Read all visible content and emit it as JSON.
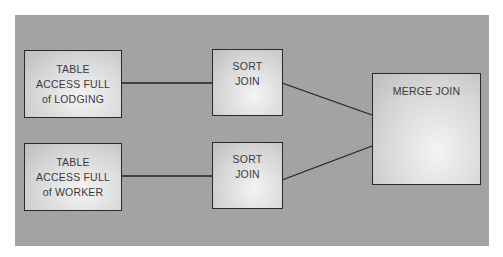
{
  "diagram": {
    "background_color": "#a3a3a3",
    "nodes": [
      {
        "id": "table_access_lodging",
        "label_lines": [
          "TABLE",
          "ACCESS FULL",
          "of LODGING"
        ]
      },
      {
        "id": "table_access_worker",
        "label_lines": [
          "TABLE",
          "ACCESS FULL",
          "of WORKER"
        ]
      },
      {
        "id": "sort_join_1",
        "label_lines": [
          "SORT",
          "JOIN"
        ]
      },
      {
        "id": "sort_join_2",
        "label_lines": [
          "SORT",
          "JOIN"
        ]
      },
      {
        "id": "merge_join",
        "label_lines": [
          "MERGE JOIN"
        ]
      }
    ],
    "edges": [
      {
        "from": "table_access_lodging",
        "to": "sort_join_1"
      },
      {
        "from": "table_access_worker",
        "to": "sort_join_2"
      },
      {
        "from": "sort_join_1",
        "to": "merge_join"
      },
      {
        "from": "sort_join_2",
        "to": "merge_join"
      }
    ]
  }
}
